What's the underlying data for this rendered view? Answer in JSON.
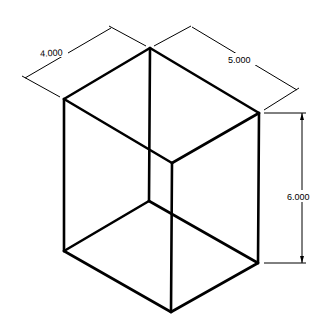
{
  "diagram": {
    "type": "isometric-box-with-dimensions",
    "dimensions": {
      "width": "4.000",
      "depth": "5.000",
      "height": "6.000"
    },
    "colors": {
      "line": "#000000",
      "background": "#ffffff"
    }
  }
}
